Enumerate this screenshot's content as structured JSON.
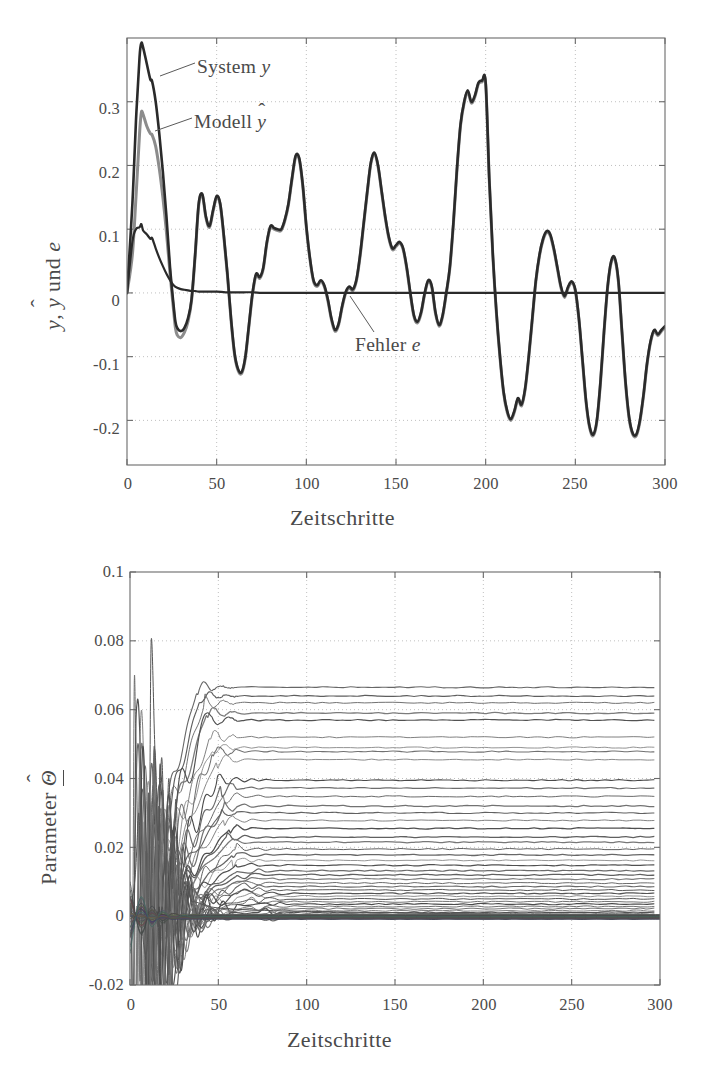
{
  "figure": {
    "panels": [
      {
        "id": "top",
        "x_axis": {
          "label": "Zeitschritte",
          "ticks": [
            "0",
            "50",
            "100",
            "150",
            "200",
            "250",
            "300"
          ],
          "tick_values": [
            0,
            50,
            100,
            150,
            200,
            250,
            300
          ],
          "min": 0,
          "max": 300
        },
        "y_axis": {
          "label_parts": {
            "pre": "y",
            "sep": ", ",
            "hat_base": "y",
            "mid": " und ",
            "post": "e"
          },
          "label_text": "y, ŷ und e",
          "ticks": [
            "-0.2",
            "-0.1",
            "0",
            "0.1",
            "0.2",
            "0.3"
          ],
          "tick_values": [
            -0.2,
            -0.1,
            0,
            0.1,
            0.2,
            0.3
          ],
          "min": -0.27,
          "max": 0.4
        },
        "annotations": [
          {
            "id": "system-y",
            "text_pre": "System ",
            "text_math": "y",
            "text": "System y"
          },
          {
            "id": "modell-yhat",
            "text_pre": "Modell ",
            "text_math": "ŷ",
            "text": "Modell ŷ"
          },
          {
            "id": "fehler-e",
            "text_pre": "Fehler ",
            "text_math": "e",
            "text": "Fehler e"
          }
        ],
        "colors": {
          "system": "#2a2a2a",
          "modell": "#8c8c8c",
          "fehler": "#2a2a2a",
          "grid": "#b9b9b9",
          "frame": "#6a6a6a"
        }
      },
      {
        "id": "bottom",
        "x_axis": {
          "label": "Zeitschritte",
          "ticks": [
            "0",
            "50",
            "100",
            "150",
            "200",
            "250",
            "300"
          ],
          "tick_values": [
            0,
            50,
            100,
            150,
            200,
            250,
            300
          ],
          "min": 0,
          "max": 300
        },
        "y_axis": {
          "label_parts": {
            "pre": "Parameter ",
            "hat_base": "Θ"
          },
          "label_text": "Parameter Θ̂",
          "ticks": [
            "-0.02",
            "0",
            "0.02",
            "0.04",
            "0.06",
            "0.08",
            "0.1"
          ],
          "tick_values": [
            -0.02,
            0,
            0.02,
            0.04,
            0.06,
            0.08,
            0.1
          ],
          "min": -0.02,
          "max": 0.1
        },
        "colors": {
          "trace": "#5d5d5d",
          "grid": "#b9b9b9",
          "frame": "#6a6a6a"
        }
      }
    ]
  },
  "chart_data": [
    {
      "type": "line",
      "id": "top-panel",
      "title": "",
      "xlabel": "Zeitschritte",
      "ylabel": "y, ŷ und e",
      "xlim": [
        0,
        300
      ],
      "ylim": [
        -0.27,
        0.4
      ],
      "grid": true,
      "legend": "annotated-inline",
      "xticks": [
        0,
        50,
        100,
        150,
        200,
        250,
        300
      ],
      "yticks": [
        -0.2,
        -0.1,
        0,
        0.1,
        0.2,
        0.3
      ],
      "series": [
        {
          "name": "System y",
          "color": "#2a2a2a",
          "x": [
            0,
            3,
            5,
            7,
            8,
            9,
            11,
            13,
            14,
            16,
            18,
            20,
            22,
            24,
            26,
            27,
            28,
            30,
            32,
            34,
            36,
            38,
            40,
            42,
            44,
            46,
            48,
            50,
            52,
            54,
            56,
            58,
            60,
            62,
            64,
            66,
            68,
            70,
            72,
            74,
            76,
            78,
            80,
            82,
            84,
            86,
            88,
            90,
            92,
            94,
            96,
            98,
            100,
            102,
            104,
            106,
            108,
            110,
            112,
            114,
            116,
            118,
            120,
            122,
            124,
            126,
            128,
            130,
            132,
            134,
            136,
            138,
            140,
            142,
            144,
            146,
            148,
            150,
            152,
            154,
            156,
            158,
            160,
            162,
            164,
            166,
            168,
            170,
            172,
            174,
            176,
            178,
            180,
            182,
            184,
            186,
            188,
            190,
            192,
            194,
            196,
            198,
            200,
            202,
            204,
            206,
            208,
            210,
            212,
            214,
            216,
            218,
            220,
            222,
            224,
            226,
            228,
            230,
            232,
            234,
            236,
            238,
            240,
            242,
            244,
            246,
            248,
            250,
            252,
            254,
            256,
            258,
            260,
            262,
            264,
            266,
            268,
            270,
            272,
            274,
            276,
            278,
            280,
            282,
            284,
            286,
            288,
            290,
            292,
            294,
            296,
            298,
            300
          ],
          "y": [
            0.0,
            0.14,
            0.27,
            0.37,
            0.392,
            0.385,
            0.36,
            0.335,
            0.332,
            0.3,
            0.25,
            0.19,
            0.12,
            0.04,
            -0.02,
            -0.045,
            -0.055,
            -0.06,
            -0.055,
            -0.04,
            -0.01,
            0.06,
            0.14,
            0.155,
            0.12,
            0.105,
            0.13,
            0.152,
            0.14,
            0.09,
            0.03,
            -0.04,
            -0.095,
            -0.12,
            -0.124,
            -0.1,
            -0.05,
            0.0,
            0.03,
            0.025,
            0.04,
            0.08,
            0.105,
            0.102,
            0.1,
            0.1,
            0.115,
            0.14,
            0.18,
            0.215,
            0.212,
            0.17,
            0.105,
            0.055,
            0.02,
            0.012,
            0.02,
            0.012,
            -0.01,
            -0.04,
            -0.058,
            -0.048,
            -0.02,
            0.002,
            0.01,
            0.006,
            0.022,
            0.06,
            0.11,
            0.16,
            0.205,
            0.22,
            0.2,
            0.16,
            0.12,
            0.088,
            0.07,
            0.075,
            0.08,
            0.07,
            0.04,
            0.0,
            -0.035,
            -0.045,
            -0.03,
            0.0,
            0.02,
            0.01,
            -0.03,
            -0.05,
            -0.035,
            0.0,
            0.04,
            0.11,
            0.195,
            0.265,
            0.3,
            0.318,
            0.3,
            0.31,
            0.33,
            0.333,
            0.33,
            0.18,
            0.06,
            -0.03,
            -0.1,
            -0.155,
            -0.185,
            -0.198,
            -0.185,
            -0.165,
            -0.175,
            -0.15,
            -0.1,
            -0.04,
            0.02,
            0.06,
            0.085,
            0.097,
            0.092,
            0.07,
            0.04,
            0.01,
            -0.005,
            0.01,
            0.018,
            0.005,
            -0.04,
            -0.105,
            -0.17,
            -0.21,
            -0.222,
            -0.2,
            -0.14,
            -0.06,
            0.01,
            0.05,
            0.055,
            0.02,
            -0.06,
            -0.14,
            -0.195,
            -0.22,
            -0.222,
            -0.2,
            -0.16,
            -0.11,
            -0.075,
            -0.058,
            -0.065,
            -0.058,
            -0.052
          ]
        },
        {
          "name": "Modell ŷ",
          "color": "#8c8c8c",
          "x": [
            0,
            3,
            5,
            7,
            8,
            9,
            11,
            13,
            14,
            16,
            18,
            20,
            22,
            24,
            26,
            27,
            28,
            30,
            32,
            34,
            36,
            38,
            40,
            42,
            44,
            46,
            48,
            50,
            52,
            54,
            56,
            58,
            60,
            62,
            64,
            66,
            68,
            70,
            72,
            74,
            76,
            78,
            80,
            82,
            84,
            86,
            88,
            90,
            92,
            94,
            96,
            98,
            100,
            102,
            104,
            106,
            108,
            110,
            112,
            114,
            116,
            118,
            120,
            122,
            124,
            126,
            128,
            130,
            132,
            134,
            136,
            138,
            140,
            142,
            144,
            146,
            148,
            150,
            152,
            154,
            156,
            158,
            160,
            162,
            164,
            166,
            168,
            170,
            172,
            174,
            176,
            178,
            180,
            182,
            184,
            186,
            188,
            190,
            192,
            194,
            196,
            198,
            200,
            202,
            204,
            206,
            208,
            210,
            212,
            214,
            216,
            218,
            220,
            222,
            224,
            226,
            228,
            230,
            232,
            234,
            236,
            238,
            240,
            242,
            244,
            246,
            248,
            250,
            252,
            254,
            256,
            258,
            260,
            262,
            264,
            266,
            268,
            270,
            272,
            274,
            276,
            278,
            280,
            282,
            284,
            286,
            288,
            290,
            292,
            294,
            296,
            298,
            300
          ],
          "y": [
            0.0,
            0.06,
            0.15,
            0.25,
            0.283,
            0.28,
            0.262,
            0.25,
            0.248,
            0.23,
            0.195,
            0.15,
            0.095,
            0.03,
            -0.028,
            -0.055,
            -0.066,
            -0.07,
            -0.062,
            -0.045,
            -0.012,
            0.058,
            0.138,
            0.153,
            0.118,
            0.103,
            0.128,
            0.15,
            0.138,
            0.088,
            0.028,
            -0.042,
            -0.097,
            -0.122,
            -0.126,
            -0.102,
            -0.052,
            -0.002,
            0.028,
            0.023,
            0.038,
            0.078,
            0.103,
            0.1,
            0.098,
            0.098,
            0.113,
            0.138,
            0.178,
            0.213,
            0.21,
            0.168,
            0.103,
            0.053,
            0.018,
            0.01,
            0.018,
            0.01,
            -0.012,
            -0.042,
            -0.06,
            -0.05,
            -0.022,
            0.0,
            0.008,
            0.004,
            0.02,
            0.058,
            0.108,
            0.158,
            0.203,
            0.218,
            0.198,
            0.158,
            0.118,
            0.086,
            0.068,
            0.073,
            0.078,
            0.068,
            0.038,
            -0.002,
            -0.037,
            -0.047,
            -0.032,
            -0.002,
            0.018,
            0.008,
            -0.032,
            -0.052,
            -0.037,
            -0.002,
            0.038,
            0.108,
            0.193,
            0.263,
            0.298,
            0.316,
            0.298,
            0.308,
            0.328,
            0.331,
            0.328,
            0.178,
            0.058,
            -0.032,
            -0.102,
            -0.157,
            -0.187,
            -0.2,
            -0.187,
            -0.167,
            -0.177,
            -0.152,
            -0.102,
            -0.042,
            0.018,
            0.058,
            0.083,
            0.095,
            0.09,
            0.068,
            0.038,
            0.008,
            -0.007,
            0.008,
            0.016,
            0.003,
            -0.042,
            -0.107,
            -0.172,
            -0.212,
            -0.224,
            -0.202,
            -0.142,
            -0.062,
            0.008,
            0.048,
            0.053,
            0.018,
            -0.062,
            -0.142,
            -0.197,
            -0.222,
            -0.224,
            -0.202,
            -0.162,
            -0.112,
            -0.077,
            -0.06,
            -0.067,
            -0.06,
            -0.054
          ]
        },
        {
          "name": "Fehler e",
          "color": "#2a2a2a",
          "x": [
            0,
            3,
            5,
            7,
            8,
            9,
            11,
            13,
            14,
            16,
            18,
            20,
            22,
            24,
            26,
            28,
            30,
            32,
            34,
            36,
            38,
            40,
            45,
            50,
            55,
            60,
            65,
            70,
            75,
            80,
            85,
            90,
            95,
            100,
            110,
            120,
            130,
            140,
            150,
            160,
            170,
            180,
            190,
            200,
            210,
            220,
            230,
            240,
            250,
            260,
            270,
            280,
            290,
            300
          ],
          "y": [
            0.0,
            0.08,
            0.1,
            0.103,
            0.108,
            0.098,
            0.092,
            0.085,
            0.086,
            0.07,
            0.055,
            0.042,
            0.03,
            0.02,
            0.012,
            0.008,
            0.006,
            0.005,
            0.004,
            0.003,
            0.003,
            0.002,
            0.002,
            0.002,
            0.001,
            0.001,
            0.001,
            0.001,
            0.0,
            0.0,
            0.0,
            0.0,
            0.0,
            0.0,
            0.0,
            0.0,
            0.0,
            0.0,
            0.0,
            0.0,
            0.0,
            0.0,
            0.0,
            0.0,
            0.0,
            0.0,
            0.0,
            0.0,
            0.0,
            0.0,
            0.0,
            0.0,
            0.0,
            0.0
          ]
        }
      ]
    },
    {
      "type": "line",
      "id": "bottom-panel",
      "title": "",
      "xlabel": "Zeitschritte",
      "ylabel": "Parameter Θ̂",
      "xlim": [
        0,
        300
      ],
      "ylim": [
        -0.02,
        0.1
      ],
      "grid": true,
      "legend": "none",
      "xticks": [
        0,
        50,
        100,
        150,
        200,
        250,
        300
      ],
      "yticks": [
        -0.02,
        0,
        0.02,
        0.04,
        0.06,
        0.08,
        0.1
      ],
      "description": "Rund 40 Parameterverlaeufe konvergieren nach etwa 30-40 Zeitschritten auf konstante Endwerte zwischen 0 und 0.067.",
      "transient": {
        "peak": 0.08,
        "peak_step": 12,
        "min": -0.011,
        "min_step": 9,
        "settle_step": 38
      },
      "final_values": [
        0.0665,
        0.064,
        0.062,
        0.059,
        0.057,
        0.052,
        0.049,
        0.0478,
        0.0455,
        0.0395,
        0.0372,
        0.0348,
        0.032,
        0.03,
        0.0278,
        0.0255,
        0.023,
        0.0215,
        0.0195,
        0.0178,
        0.0162,
        0.0148,
        0.0132,
        0.012,
        0.0108,
        0.0096,
        0.0086,
        0.0076,
        0.0066,
        0.0058,
        0.005,
        0.0042,
        0.0035,
        0.0028,
        0.0022,
        0.0016,
        0.0011,
        0.0007,
        0.0004,
        0.0001,
        -0.0002,
        -0.0005,
        -0.0008
      ]
    }
  ]
}
